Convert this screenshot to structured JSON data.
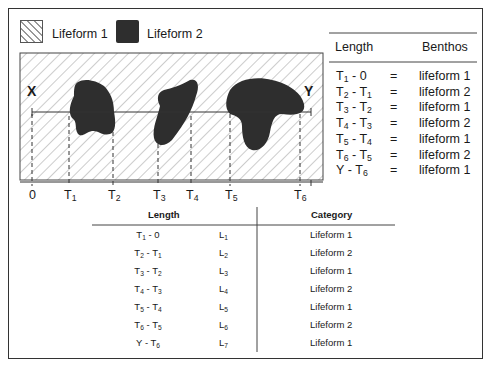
{
  "legend": {
    "items": [
      {
        "label": "Lifeform 1",
        "pattern": "diagonal-hatch"
      },
      {
        "label": "Lifeform 2",
        "pattern": "dark-fill",
        "color": "#2e2e2e"
      }
    ]
  },
  "diagram": {
    "start_label": "X",
    "end_label": "Y",
    "axis_ticks": [
      {
        "base": "0",
        "sub": ""
      },
      {
        "base": "T",
        "sub": "1"
      },
      {
        "base": "T",
        "sub": "2"
      },
      {
        "base": "T",
        "sub": "3"
      },
      {
        "base": "T",
        "sub": "4"
      },
      {
        "base": "T",
        "sub": "5"
      },
      {
        "base": "T",
        "sub": "6"
      }
    ]
  },
  "right_table": {
    "headers": {
      "length": "Length",
      "benthos": "Benthos"
    },
    "rows": [
      {
        "a": "T",
        "a_sub": "1",
        "b": "0",
        "b_sub": "",
        "eq": "=",
        "value": "lifeform 1"
      },
      {
        "a": "T",
        "a_sub": "2",
        "b": "T",
        "b_sub": "1",
        "eq": "=",
        "value": "lifeform 2"
      },
      {
        "a": "T",
        "a_sub": "3",
        "b": "T",
        "b_sub": "2",
        "eq": "=",
        "value": "lifeform 1"
      },
      {
        "a": "T",
        "a_sub": "4",
        "b": "T",
        "b_sub": "3",
        "eq": "=",
        "value": "lifeform 2"
      },
      {
        "a": "T",
        "a_sub": "5",
        "b": "T",
        "b_sub": "4",
        "eq": "=",
        "value": "lifeform 1"
      },
      {
        "a": "T",
        "a_sub": "6",
        "b": "T",
        "b_sub": "5",
        "eq": "=",
        "value": "lifeform 2"
      },
      {
        "a": "Y",
        "a_sub": "",
        "b": "T",
        "b_sub": "6",
        "eq": "=",
        "value": "lifeform 1"
      }
    ]
  },
  "bottom_table": {
    "headers": {
      "length": "Length",
      "category": "Category"
    },
    "rows": [
      {
        "a": "T",
        "a_sub": "1",
        "b": "0",
        "b_sub": "",
        "l": "L",
        "l_sub": "1",
        "category": "Lifeform 1"
      },
      {
        "a": "T",
        "a_sub": "2",
        "b": "T",
        "b_sub": "1",
        "l": "L",
        "l_sub": "2",
        "category": "Lifeform 2"
      },
      {
        "a": "T",
        "a_sub": "3",
        "b": "T",
        "b_sub": "2",
        "l": "L",
        "l_sub": "3",
        "category": "Lifeform 1"
      },
      {
        "a": "T",
        "a_sub": "4",
        "b": "T",
        "b_sub": "3",
        "l": "L",
        "l_sub": "4",
        "category": "Lifeform 2"
      },
      {
        "a": "T",
        "a_sub": "5",
        "b": "T",
        "b_sub": "4",
        "l": "L",
        "l_sub": "5",
        "category": "Lifeform 1"
      },
      {
        "a": "T",
        "a_sub": "6",
        "b": "T",
        "b_sub": "5",
        "l": "L",
        "l_sub": "6",
        "category": "Lifeform 2"
      },
      {
        "a": "Y",
        "a_sub": "",
        "b": "T",
        "b_sub": "6",
        "l": "L",
        "l_sub": "7",
        "category": "Lifeform 1"
      }
    ]
  }
}
